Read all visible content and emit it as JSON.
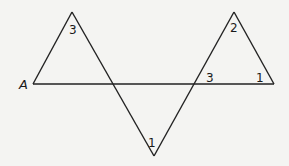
{
  "diagram": {
    "point_labels": {
      "A": "A"
    },
    "angle_labels": {
      "left_apex": "3",
      "bottom_vertex": "1",
      "right_apex": "2",
      "intersection_right": "3",
      "right_vertex": "1"
    },
    "colors": {
      "line": "#222222",
      "background": "#f4f4f2"
    }
  }
}
